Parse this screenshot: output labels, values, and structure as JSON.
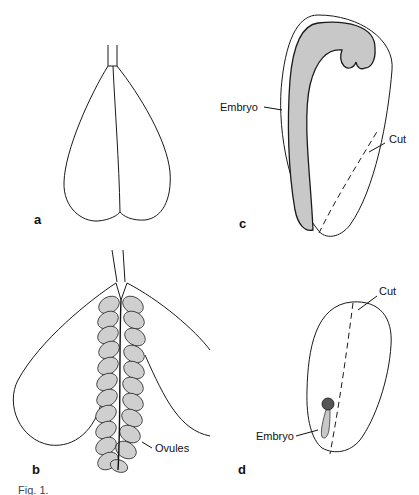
{
  "figure": {
    "panels": [
      {
        "id": "a",
        "label": "a"
      },
      {
        "id": "b",
        "label": "b",
        "annotations": [
          "Ovules"
        ]
      },
      {
        "id": "c",
        "label": "c",
        "annotations": [
          "Embryo",
          "Cut"
        ]
      },
      {
        "id": "d",
        "label": "d",
        "annotations": [
          "Embryo",
          "Cut"
        ]
      }
    ],
    "labels": {
      "a": "a",
      "b": "b",
      "c": "c",
      "d": "d",
      "ovules": "Ovules",
      "embryo_c": "Embryo",
      "cut_c": "Cut",
      "embryo_d": "Embryo",
      "cut_d": "Cut"
    },
    "caption": "Fig. 1."
  },
  "colors": {
    "line": "#1a1a1a",
    "embryo_fill": "#c8c8c8",
    "ovule_fill": "#cfcfcf",
    "background": "#ffffff"
  }
}
